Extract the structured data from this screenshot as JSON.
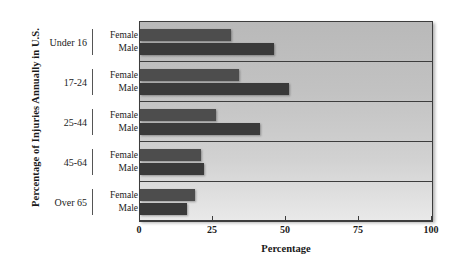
{
  "chart_data": {
    "type": "bar",
    "orientation": "horizontal",
    "title": "",
    "xlabel": "Percentage",
    "ylabel": "Percentage of Injuries Annually in U.S.",
    "xlim": [
      0,
      100
    ],
    "xticks": [
      0,
      25,
      50,
      75,
      100
    ],
    "xticklabels": [
      "0",
      "25",
      "50",
      "75",
      "100"
    ],
    "grid": false,
    "legend": "none",
    "categories": [
      "Under 16",
      "17-24",
      "25-44",
      "45-64",
      "Over 65"
    ],
    "series": [
      {
        "name": "Female",
        "values": [
          31,
          34,
          26,
          21,
          19
        ],
        "color": "#4d4d4d"
      },
      {
        "name": "Male",
        "values": [
          46,
          51,
          41,
          22,
          16
        ],
        "color": "#3a3a3a"
      }
    ],
    "groups": [
      {
        "category": "Under 16",
        "female": 31,
        "male": 46
      },
      {
        "category": "17-24",
        "female": 34,
        "male": 51
      },
      {
        "category": "25-44",
        "female": 26,
        "male": 41
      },
      {
        "category": "45-64",
        "female": 21,
        "male": 22
      },
      {
        "category": "Over 65",
        "female": 19,
        "male": 16
      }
    ],
    "series_labels": {
      "female": "Female",
      "male": "Male"
    }
  },
  "colors": {
    "female_bar": "#4d4d4d",
    "male_bar": "#3a3a3a",
    "axis": "#3d3d3d",
    "text": "#1a1a1a",
    "plot_bg_top": "#b9b9b9",
    "plot_bg_bottom": "#e9e9e9"
  }
}
